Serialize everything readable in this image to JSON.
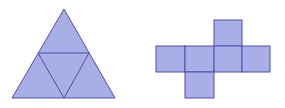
{
  "figure": {
    "colors": {
      "fill": "#a9aee6",
      "stroke": "#4a4fa8",
      "background": "#ffffff"
    },
    "tetrahedron_net": {
      "outer_triangle": [
        [
          64,
          9
        ],
        [
          12,
          98
        ],
        [
          115,
          98
        ]
      ],
      "inner_triangle": [
        [
          38,
          53
        ],
        [
          89,
          53
        ],
        [
          64,
          98
        ]
      ]
    },
    "cube_net": {
      "squares": [
        {
          "x": 214,
          "y": 20,
          "w": 28,
          "h": 26
        },
        {
          "x": 156,
          "y": 46,
          "w": 29,
          "h": 26
        },
        {
          "x": 185,
          "y": 46,
          "w": 29,
          "h": 26
        },
        {
          "x": 214,
          "y": 46,
          "w": 28,
          "h": 26
        },
        {
          "x": 242,
          "y": 46,
          "w": 28,
          "h": 26
        },
        {
          "x": 185,
          "y": 72,
          "w": 29,
          "h": 26
        }
      ]
    }
  }
}
